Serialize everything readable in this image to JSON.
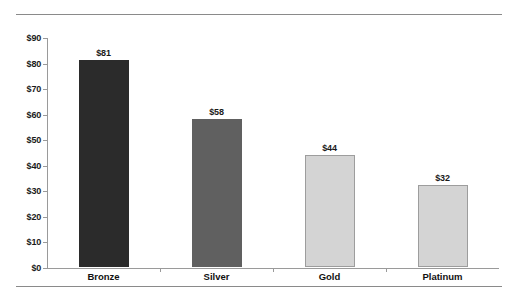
{
  "chart_data": {
    "type": "bar",
    "title": "",
    "subtitle": "",
    "xlabel": "",
    "ylabel": "",
    "categories": [
      "Bronze",
      "Silver",
      "Gold",
      "Platinum"
    ],
    "values": [
      81,
      58,
      44,
      32
    ],
    "value_labels": [
      "$81",
      "$58",
      "$44",
      "$32"
    ],
    "ylim": [
      0,
      90
    ],
    "ytick_values": [
      0,
      10,
      20,
      30,
      40,
      50,
      60,
      70,
      80,
      90
    ],
    "ytick_labels": [
      "$0",
      "$10",
      "$20",
      "$30",
      "$40",
      "$50",
      "$60",
      "$70",
      "$80",
      "$90"
    ],
    "grid": false,
    "legend": "none",
    "currency": "USD",
    "bar_colors": [
      "#2b2b2b",
      "#606060",
      "#d4d4d4",
      "#d4d4d4"
    ],
    "bar_outlined": [
      false,
      false,
      true,
      true
    ],
    "axis_color": "#9a9a9a",
    "rule_color": "#8a8a8a",
    "background": "#ffffff"
  }
}
